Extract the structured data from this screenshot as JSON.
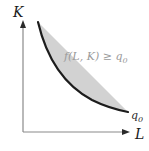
{
  "figure": {
    "background_color": "#ffffff"
  },
  "axes": {
    "y_axis": {
      "label": "K",
      "name": "capital-axis",
      "color": "#8a8a8a",
      "x": 23,
      "y_top": 22,
      "y_bottom": 132,
      "label_x": 13,
      "label_y": 17,
      "arrow": "up"
    },
    "x_axis": {
      "label": "L",
      "name": "labor-axis",
      "color": "#8a8a8a",
      "y": 132,
      "x_left": 23,
      "x_right": 128,
      "label_x": 135,
      "label_y": 139,
      "arrow": "right"
    }
  },
  "region": {
    "name": "upper-contour-set",
    "fill_color": "#d2d2d2",
    "label_main": "f(L, K) ≥ q",
    "label_sub": "0",
    "label_x": 64,
    "label_y": 60,
    "top_y": 22,
    "right_x": 128
  },
  "curve": {
    "name": "isoquant-curve",
    "stroke_color": "#1c1c1c",
    "stroke_width": 2.2,
    "start_x": 38,
    "start_y": 22,
    "end_x": 128,
    "end_y": 112,
    "path": "M 38 22 C 46 56, 62 84, 92 100 C 106 107, 118 110, 128 112"
  },
  "level_label": {
    "name": "isoquant-level-label",
    "main": "q",
    "sub": "0",
    "x": 131,
    "y": 119
  },
  "chart_data": {
    "type": "line",
    "xlabel": "L",
    "ylabel": "K",
    "annotations": [
      {
        "text": "f(L, K) ≥ q0",
        "x": 64,
        "y": 60
      },
      {
        "text": "q0",
        "x": 131,
        "y": 119
      }
    ],
    "series": [
      {
        "name": "isoquant q0",
        "x": [
          38,
          44,
          52,
          62,
          74,
          88,
          102,
          115,
          128
        ],
        "y": [
          22,
          44,
          62,
          78,
          90,
          98,
          105,
          109,
          112
        ]
      }
    ],
    "shaded_region": {
      "name": "f(L, K) >= q0",
      "description": "area above and to the right of the isoquant",
      "fill": "#d2d2d2"
    },
    "grid": false,
    "legend": false,
    "xlim": [
      23,
      128
    ],
    "ylim": [
      22,
      132
    ]
  }
}
